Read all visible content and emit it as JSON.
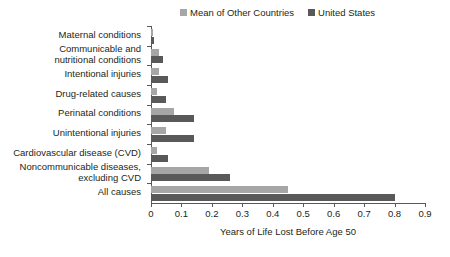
{
  "chart_data": {
    "type": "bar",
    "orientation": "horizontal",
    "title": "",
    "xlabel": "Years of Life Lost Before Age 50",
    "ylabel": "",
    "xlim": [
      0,
      0.9
    ],
    "xticks": [
      "0",
      "0.1",
      "0.2",
      "0.3",
      "0.4",
      "0.5",
      "0.6",
      "0.7",
      "0.8",
      "0.9"
    ],
    "xtick_values": [
      0,
      0.1,
      0.2,
      0.3,
      0.4,
      0.5,
      0.6,
      0.7,
      0.8,
      0.9
    ],
    "grid": false,
    "legend_position": "top-right",
    "categories": [
      "Maternal conditions",
      "Communicable and nutritional conditions",
      "Intentional injuries",
      "Drug-related causes",
      "Perinatal conditions",
      "Unintentional injuries",
      "Cardiovascular disease (CVD)",
      "Noncommunicable diseases, excluding CVD",
      "All causes"
    ],
    "category_lines": [
      [
        "Maternal conditions"
      ],
      [
        "Communicable and",
        "nutritional conditions"
      ],
      [
        "Intentional injuries"
      ],
      [
        "Drug-related causes"
      ],
      [
        "Perinatal conditions"
      ],
      [
        "Unintentional injuries"
      ],
      [
        "Cardiovascular disease (CVD)"
      ],
      [
        "Noncommunicable diseases,",
        "excluding CVD"
      ],
      [
        "All causes"
      ]
    ],
    "series": [
      {
        "name": "Mean of Other Countries",
        "color": "#a6a6a6",
        "values": [
          0.005,
          0.025,
          0.025,
          0.02,
          0.075,
          0.05,
          0.02,
          0.19,
          0.45
        ]
      },
      {
        "name": "United States",
        "color": "#595959",
        "values": [
          0.01,
          0.04,
          0.055,
          0.05,
          0.14,
          0.14,
          0.055,
          0.26,
          0.8
        ]
      }
    ]
  },
  "legend": {
    "entries": [
      {
        "label": "Mean of Other Countries",
        "color": "#a6a6a6"
      },
      {
        "label": "United States",
        "color": "#595959"
      }
    ]
  },
  "axis": {
    "x_title": "Years of Life Lost Before Age 50"
  }
}
